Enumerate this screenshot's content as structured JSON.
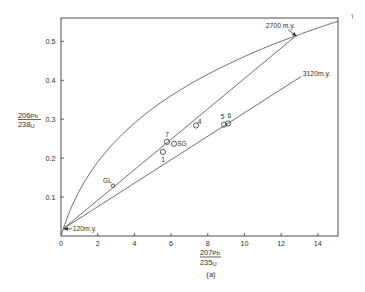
{
  "chart_data": {
    "type": "scatter",
    "title": "",
    "caption": "(a)",
    "xlabel": {
      "numerator": {
        "mass": "207",
        "element": "Pb"
      },
      "denominator": {
        "mass": "235",
        "element": "U"
      }
    },
    "ylabel": {
      "numerator": {
        "mass": "206",
        "element": "Pb"
      },
      "denominator": {
        "mass": "238",
        "element": "U"
      }
    },
    "xlim": [
      0,
      15.1
    ],
    "ylim": [
      0,
      0.56
    ],
    "grid": false,
    "legend": null,
    "xticks": [
      0,
      2,
      4,
      6,
      8,
      10,
      12,
      14
    ],
    "xtick_labels": [
      "0",
      "2",
      "4",
      "6",
      "8",
      "10",
      "12",
      "14"
    ],
    "yticks": [
      0.1,
      0.2,
      0.3,
      0.4,
      0.5
    ],
    "ytick_labels": [
      "0.1",
      "0.2",
      "0.3",
      "0.4",
      "0.5"
    ],
    "series": [
      {
        "id": "concordia",
        "type": "line",
        "x": [
          0,
          0.05,
          0.102,
          0.157,
          0.275,
          0.44,
          0.626,
          1.073,
          1.643,
          2.37,
          3.297,
          4.479,
          5.987,
          7.908,
          10.359,
          12.797,
          15.12
        ],
        "y": [
          0,
          0.0077,
          0.0155,
          0.0233,
          0.0392,
          0.0593,
          0.0799,
          0.1222,
          0.1662,
          0.2118,
          0.2593,
          0.3087,
          0.3599,
          0.4131,
          0.4686,
          0.5144,
          0.5521
        ]
      },
      {
        "id": "discordia-2700",
        "type": "line",
        "x": [
          0.124,
          12.8
        ],
        "y": [
          0.0186,
          0.514
        ]
      },
      {
        "id": "discordia-3120",
        "type": "line",
        "x": [
          0.124,
          13.1
        ],
        "y": [
          0.0186,
          0.41
        ]
      },
      {
        "id": "samples",
        "type": "scatter",
        "points": [
          {
            "label": "1",
            "x": 5.56,
            "y": 0.216,
            "label_dx": 0,
            "label_dy": 10,
            "anchor": "middle"
          },
          {
            "label": "7",
            "x": 5.78,
            "y": 0.242,
            "label_dx": 0,
            "label_dy": -4.5,
            "anchor": "middle"
          },
          {
            "label": "SG",
            "x": 6.16,
            "y": 0.237,
            "label_dx": 3.2,
            "label_dy": 2.2,
            "anchor": "start"
          },
          {
            "label": "4",
            "x": 7.36,
            "y": 0.284,
            "label_dx": 1.8,
            "label_dy": -1.5,
            "anchor": "start"
          },
          {
            "label": "5",
            "x": 8.89,
            "y": 0.286,
            "label_dx": -1.5,
            "label_dy": -5.5,
            "anchor": "middle"
          },
          {
            "label": "6",
            "x": 9.11,
            "y": 0.289,
            "label_dx": 1.2,
            "label_dy": -5.8,
            "anchor": "middle"
          },
          {
            "label": "GL",
            "x": 2.84,
            "y": 0.129,
            "label_dx": -1.2,
            "label_dy": -3,
            "anchor": "end",
            "small": true
          }
        ]
      }
    ],
    "annotations": [
      {
        "text": "2700 m.y.",
        "x": 12.8,
        "y": 0.514,
        "label_dx": -30,
        "label_dy": -7.5,
        "arrow": true,
        "arrow_dx": -8,
        "arrow_dy": -6.5
      },
      {
        "text": "3120m.y.",
        "x": 13.1,
        "y": 0.41,
        "label_dx": 1.5,
        "label_dy": -0.8,
        "arrow": false
      },
      {
        "text": "120m.y.",
        "x": 0.124,
        "y": 0.0186,
        "label_dx": 9.5,
        "label_dy": 2.6,
        "arrow": true,
        "arrow_dx": 8.5,
        "arrow_dy": 0
      }
    ]
  }
}
